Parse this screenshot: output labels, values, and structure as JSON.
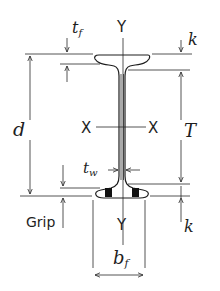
{
  "diagram": {
    "type": "wide-flange beam cross-section (rail-like I-section) with dimension annotations",
    "axes": {
      "y_top": "Y",
      "y_bottom": "Y",
      "x_left": "X",
      "x_right": "X"
    },
    "dimensions": {
      "flange_thickness": {
        "symbol": "t",
        "subscript": "f"
      },
      "web_thickness": {
        "symbol": "t",
        "subscript": "w"
      },
      "depth": {
        "symbol": "d"
      },
      "fillet_top": {
        "symbol": "k"
      },
      "fillet_bottom": {
        "symbol": "k"
      },
      "web_clear_height": {
        "symbol": "T"
      },
      "flange_width": {
        "symbol": "b",
        "subscript": "f"
      }
    },
    "grip_label": "Grip",
    "colors": {
      "line": "#2a2a2a",
      "background": "#ffffff"
    }
  }
}
